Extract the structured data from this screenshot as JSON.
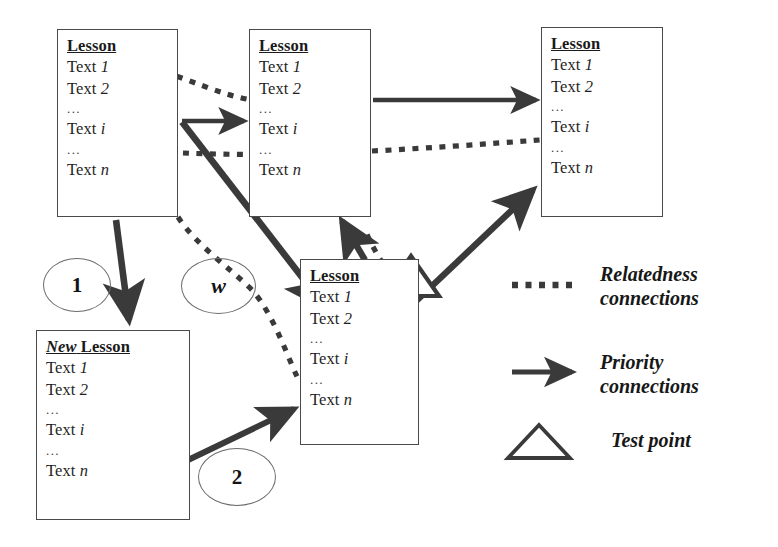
{
  "diagram": {
    "colors": {
      "stroke": "#3a3a3a",
      "box_border": "#4a4a4a",
      "text": "#1a1a1a",
      "background": "#ffffff"
    }
  },
  "nodes": {
    "lesson_top_left": {
      "title": "Lesson",
      "title_prefix": "",
      "lines": [
        "Text 1",
        "Text 2",
        "...",
        "Text i",
        "...",
        "Text n"
      ]
    },
    "lesson_top_middle": {
      "title": "Lesson",
      "title_prefix": "",
      "lines": [
        "Text 1",
        "Text 2",
        "...",
        "Text i",
        "...",
        "Text n"
      ]
    },
    "lesson_top_right": {
      "title": "Lesson",
      "title_prefix": "",
      "lines": [
        "Text 1",
        "Text 2",
        "...",
        "Text i",
        "...",
        "Text n"
      ]
    },
    "lesson_bottom_middle": {
      "title": "Lesson",
      "title_prefix": "",
      "lines": [
        "Text 1",
        "Text 2",
        "...",
        "Text i",
        "...",
        "Text n"
      ]
    },
    "new_lesson": {
      "title": "Lesson",
      "title_prefix": "New",
      "lines": [
        "Text 1",
        "Text 2",
        "...",
        "Text i",
        "...",
        "Text n"
      ]
    }
  },
  "markers": {
    "step_one": "1",
    "step_two": "2",
    "weight": "w"
  },
  "legend": {
    "relatedness": {
      "line1": "Relatedness",
      "line2": "connections",
      "icon": "dotted-line-icon"
    },
    "priority": {
      "line1": "Priority",
      "line2": "connections",
      "icon": "solid-arrow-icon"
    },
    "test_point": {
      "line1": "Test point",
      "icon": "triangle-icon"
    }
  }
}
